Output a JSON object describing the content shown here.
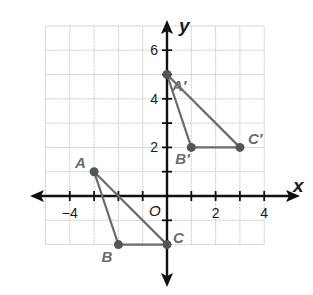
{
  "figure": {
    "axes": {
      "x_label": "x",
      "y_label": "y",
      "origin_label": "O",
      "x_ticks": [
        {
          "value": -4,
          "label": "−4"
        },
        {
          "value": 2,
          "label": "2"
        },
        {
          "value": 4,
          "label": "4"
        }
      ],
      "y_ticks": [
        {
          "value": 2,
          "label": "2"
        },
        {
          "value": 4,
          "label": "4"
        },
        {
          "value": 6,
          "label": "6"
        }
      ],
      "x_range": [
        -5,
        4
      ],
      "y_range": [
        -2,
        7
      ],
      "grid": true,
      "grid_step": 1
    },
    "colors": {
      "grid": "#c8c8c8",
      "axis": "#111111",
      "triangle": "#6b6b6b",
      "point": "#555555",
      "label": "#6b6b6b"
    },
    "triangles": [
      {
        "name": "ABC",
        "vertices": [
          {
            "label": "A",
            "x": -3,
            "y": 1
          },
          {
            "label": "B",
            "x": -2,
            "y": -2
          },
          {
            "label": "C",
            "x": 0,
            "y": -2
          }
        ]
      },
      {
        "name": "A'B'C'",
        "vertices": [
          {
            "label": "A′",
            "x": 0,
            "y": 5
          },
          {
            "label": "B′",
            "x": 1,
            "y": 2
          },
          {
            "label": "C′",
            "x": 3,
            "y": 2
          }
        ]
      }
    ]
  },
  "chart_data": {
    "type": "scatter",
    "title": "",
    "xlabel": "x",
    "ylabel": "y",
    "xlim": [
      -5,
      4
    ],
    "ylim": [
      -2,
      7
    ],
    "grid": true,
    "series": [
      {
        "name": "ABC",
        "points": [
          {
            "label": "A",
            "x": -3,
            "y": 1
          },
          {
            "label": "B",
            "x": -2,
            "y": -2
          },
          {
            "label": "C",
            "x": 0,
            "y": -2
          }
        ],
        "closed_polygon": true
      },
      {
        "name": "A'B'C'",
        "points": [
          {
            "label": "A'",
            "x": 0,
            "y": 5
          },
          {
            "label": "B'",
            "x": 1,
            "y": 2
          },
          {
            "label": "C'",
            "x": 3,
            "y": 2
          }
        ],
        "closed_polygon": true
      }
    ],
    "x_tick_labels": [
      "-4",
      "2",
      "4"
    ],
    "y_tick_labels": [
      "2",
      "4",
      "6"
    ],
    "annotations": [
      "O"
    ]
  }
}
